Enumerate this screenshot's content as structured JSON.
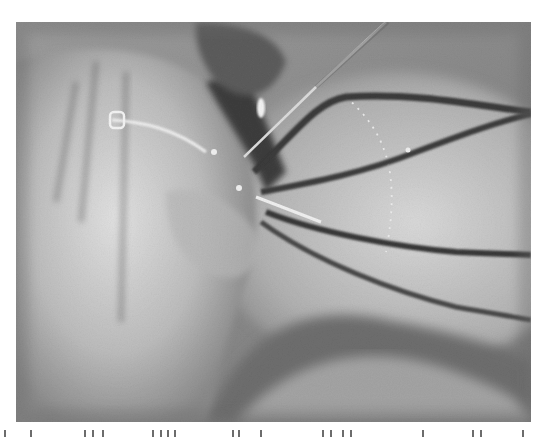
{
  "figure": {
    "kind": "grayscale endoscopic surgical photograph",
    "color_mode": "grayscale",
    "colors": {
      "background": "#ffffff",
      "tissue_light": "#d8d8d8",
      "tissue_mid": "#9a9a9a",
      "shadow": "#4a4a4a",
      "instrument": "#3a3a3a",
      "highlight": "#f4f4f4"
    }
  },
  "caption": {
    "visible": "partially (clipped at bottom edge, text illegible)"
  }
}
